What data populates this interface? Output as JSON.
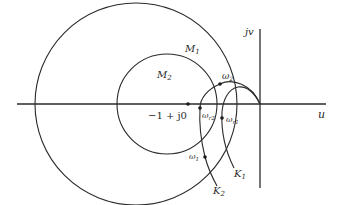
{
  "diagram": {
    "type": "nichols-style M-circle / Nyquist frequency response diagram",
    "axes": {
      "horizontal_label": "u",
      "vertical_label": "jv"
    },
    "circles": [
      {
        "name": "M1",
        "label": "M",
        "subscript": "1"
      },
      {
        "name": "M2",
        "label": "M",
        "subscript": "2"
      }
    ],
    "curves": [
      {
        "name": "K1",
        "label": "K",
        "subscript": "1"
      },
      {
        "name": "K2",
        "label": "K",
        "subscript": "2"
      }
    ],
    "points": [
      {
        "name": "critical-point",
        "label": "−1 + j0"
      },
      {
        "name": "omega2",
        "label": "ω",
        "subscript": "2"
      },
      {
        "name": "omega-r2",
        "label": "ω",
        "subscript": "r2"
      },
      {
        "name": "omega-r1",
        "label": "ω",
        "subscript": "r1"
      },
      {
        "name": "omega1",
        "label": "ω",
        "subscript": "1"
      }
    ],
    "colors": {
      "line": "#2a2a2a",
      "background": "#ffffff"
    }
  }
}
